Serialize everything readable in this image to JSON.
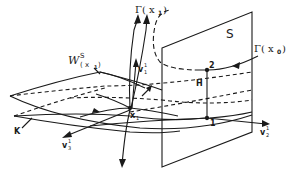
{
  "diagram": {
    "type": "geometric-dynamics-diagram",
    "colors": {
      "ink": "#1a1a1a",
      "background": "#ffffff"
    },
    "labels": {
      "section_plane": "S",
      "gamma_x1": "Γ( x",
      "gamma_x1_sub": "1",
      "gamma_x1_close": ")",
      "gamma_x0": "Γ( x",
      "gamma_x0_sub": "0",
      "gamma_x0_close": ")",
      "stable_manifold": "W",
      "stable_manifold_sup": "S",
      "stable_manifold_arg": "( x",
      "stable_manifold_arg_sub": "1",
      "stable_manifold_arg_close": ")",
      "v1": "v",
      "v1_sub": "1",
      "v1_sup": "1",
      "v2": "v",
      "v2_sub": "2",
      "v2_sup": "1",
      "v3": "v",
      "v3_sub": "3",
      "v3_sup": "1",
      "point_x1": "x",
      "point_x1_sub": "1",
      "point_1": "1",
      "point_2": "2",
      "height_H": "H",
      "surface_K": "K"
    }
  }
}
